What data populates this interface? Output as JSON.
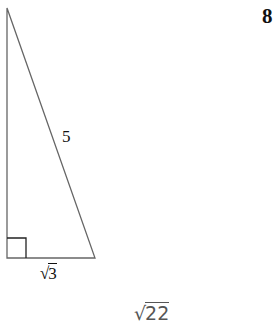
{
  "problem": {
    "number": "8"
  },
  "triangle": {
    "type": "right-triangle",
    "vertices": {
      "top": [
        7,
        8
      ],
      "right_angle": [
        7,
        258
      ],
      "base_end": [
        95,
        258
      ]
    },
    "line_color": "#555555",
    "right_angle_marker": true,
    "labels": {
      "hypotenuse": "5",
      "base_radicand": "3"
    }
  },
  "answer": {
    "radical_sign": "√",
    "radicand": "22",
    "color": "#555555"
  }
}
